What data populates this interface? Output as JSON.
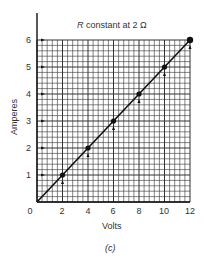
{
  "chart_data": {
    "type": "line",
    "title": "R constant at 2 Ω",
    "title_italic_part": "R",
    "title_rest": " constant at 2 Ω",
    "xlabel": "Volts",
    "ylabel": "Amperes",
    "caption": "(c)",
    "x": [
      2,
      4,
      6,
      8,
      10,
      12
    ],
    "series": [
      {
        "name": "I = V/R",
        "values": [
          1,
          2,
          3,
          4,
          5,
          6
        ]
      }
    ],
    "line": {
      "from": [
        0,
        0
      ],
      "to": [
        12,
        6
      ]
    },
    "xlim": [
      0,
      12
    ],
    "ylim": [
      0,
      6
    ],
    "xticks": [
      "0",
      "2",
      "4",
      "6",
      "8",
      "10",
      "12"
    ],
    "yticks": [
      "1",
      "2",
      "3",
      "4",
      "5",
      "6"
    ],
    "grid": true,
    "minor_grid_per_major_x": 5,
    "minor_grid_per_major_y": 5
  }
}
